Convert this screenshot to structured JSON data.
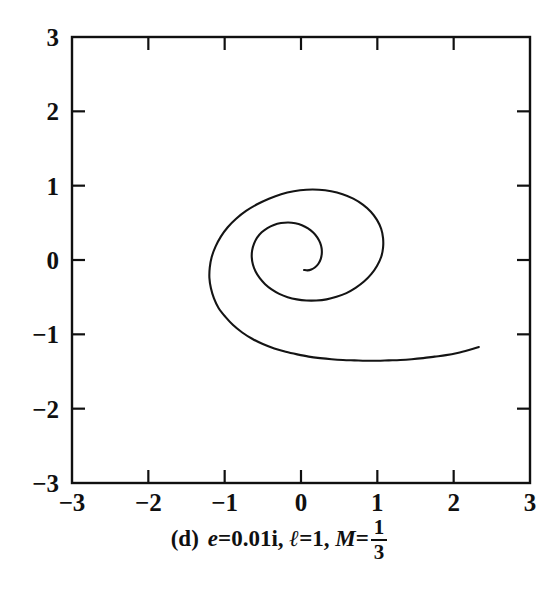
{
  "figure": {
    "label": "(d)",
    "caption_text": "(d) e = 0.01i, l = 1, M = 1/3",
    "params": {
      "e_symbol": "e",
      "e_relation": "=",
      "e_value": "0.01i",
      "comma_1": ",",
      "l_symbol": "ℓ",
      "l_relation": "=",
      "l_value": "1",
      "comma_2": ",",
      "M_symbol": "M",
      "M_relation": "=",
      "M_numerator": "1",
      "M_denominator": "3"
    }
  },
  "chart_data": {
    "type": "line",
    "title": "",
    "subtitle": "",
    "xlabel": "",
    "ylabel": "",
    "xlim": [
      -3,
      3
    ],
    "ylim": [
      -3,
      3
    ],
    "grid": false,
    "legend": null,
    "legend_position": "none",
    "xticks": [
      -3,
      -2,
      -1,
      0,
      1,
      2,
      3
    ],
    "xtick_labels": [
      "−3",
      "−2",
      "−1",
      "0",
      "1",
      "2",
      "3"
    ],
    "yticks": [
      -3,
      -2,
      -1,
      0,
      1,
      2,
      3
    ],
    "ytick_labels": [
      "−3",
      "−2",
      "−1",
      "0",
      "1",
      "2",
      "3"
    ],
    "tick_direction": "in",
    "frame": "box",
    "line_color": "#141414",
    "line_width": 2.1,
    "series": [
      {
        "name": "orbit",
        "points": [
          [
            2.33,
            -1.17
          ],
          [
            2.2,
            -1.21
          ],
          [
            2.05,
            -1.25
          ],
          [
            1.9,
            -1.28
          ],
          [
            1.75,
            -1.3
          ],
          [
            1.6,
            -1.32
          ],
          [
            1.45,
            -1.335
          ],
          [
            1.3,
            -1.345
          ],
          [
            1.15,
            -1.35
          ],
          [
            1.0,
            -1.355
          ],
          [
            0.85,
            -1.355
          ],
          [
            0.7,
            -1.35
          ],
          [
            0.55,
            -1.345
          ],
          [
            0.4,
            -1.335
          ],
          [
            0.25,
            -1.32
          ],
          [
            0.1,
            -1.3
          ],
          [
            -0.05,
            -1.27
          ],
          [
            -0.2,
            -1.235
          ],
          [
            -0.35,
            -1.19
          ],
          [
            -0.5,
            -1.13
          ],
          [
            -0.64,
            -1.06
          ],
          [
            -0.77,
            -0.975
          ],
          [
            -0.89,
            -0.875
          ],
          [
            -0.99,
            -0.765
          ],
          [
            -1.08,
            -0.645
          ],
          [
            -1.14,
            -0.515
          ],
          [
            -1.18,
            -0.38
          ],
          [
            -1.2,
            -0.24
          ],
          [
            -1.195,
            -0.1
          ],
          [
            -1.17,
            0.04
          ],
          [
            -1.12,
            0.18
          ],
          [
            -1.05,
            0.315
          ],
          [
            -0.96,
            0.44
          ],
          [
            -0.85,
            0.555
          ],
          [
            -0.72,
            0.66
          ],
          [
            -0.575,
            0.75
          ],
          [
            -0.42,
            0.825
          ],
          [
            -0.26,
            0.885
          ],
          [
            -0.095,
            0.925
          ],
          [
            0.07,
            0.945
          ],
          [
            0.235,
            0.945
          ],
          [
            0.395,
            0.925
          ],
          [
            0.545,
            0.885
          ],
          [
            0.685,
            0.825
          ],
          [
            0.81,
            0.745
          ],
          [
            0.915,
            0.65
          ],
          [
            0.995,
            0.54
          ],
          [
            1.05,
            0.42
          ],
          [
            1.075,
            0.295
          ],
          [
            1.075,
            0.165
          ],
          [
            1.05,
            0.04
          ],
          [
            0.995,
            -0.08
          ],
          [
            0.92,
            -0.19
          ],
          [
            0.825,
            -0.29
          ],
          [
            0.715,
            -0.375
          ],
          [
            0.595,
            -0.445
          ],
          [
            0.465,
            -0.495
          ],
          [
            0.335,
            -0.53
          ],
          [
            0.2,
            -0.545
          ],
          [
            0.07,
            -0.545
          ],
          [
            -0.055,
            -0.53
          ],
          [
            -0.175,
            -0.5
          ],
          [
            -0.285,
            -0.455
          ],
          [
            -0.385,
            -0.395
          ],
          [
            -0.47,
            -0.325
          ],
          [
            -0.54,
            -0.245
          ],
          [
            -0.595,
            -0.155
          ],
          [
            -0.63,
            -0.06
          ],
          [
            -0.645,
            0.035
          ],
          [
            -0.64,
            0.13
          ],
          [
            -0.615,
            0.22
          ],
          [
            -0.575,
            0.3
          ],
          [
            -0.515,
            0.372
          ],
          [
            -0.44,
            0.43
          ],
          [
            -0.355,
            0.472
          ],
          [
            -0.262,
            0.497
          ],
          [
            -0.168,
            0.505
          ],
          [
            -0.075,
            0.495
          ],
          [
            0.012,
            0.468
          ],
          [
            0.092,
            0.425
          ],
          [
            0.16,
            0.37
          ],
          [
            0.213,
            0.305
          ],
          [
            0.25,
            0.233
          ],
          [
            0.27,
            0.158
          ],
          [
            0.272,
            0.083
          ],
          [
            0.258,
            0.012
          ],
          [
            0.228,
            -0.05
          ],
          [
            0.185,
            -0.098
          ],
          [
            0.135,
            -0.128
          ],
          [
            0.085,
            -0.14
          ],
          [
            0.04,
            -0.134
          ]
        ]
      }
    ]
  }
}
